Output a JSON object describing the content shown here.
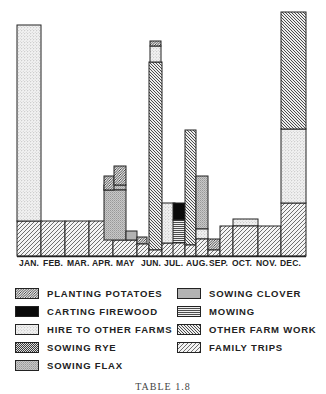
{
  "chart_data": {
    "type": "bar",
    "subtype": "overlapping-stacked-bar",
    "title": "",
    "caption": "TABLE 1.8",
    "xlabel": "",
    "ylabel": "",
    "grid": false,
    "legend_position": "bottom",
    "categories": [
      "JAN.",
      "FEB.",
      "MAR.",
      "APR.",
      "MAY",
      "JUN.",
      "JUL.",
      "AUG.",
      "SEP.",
      "OCT.",
      "NOV.",
      "DEC."
    ],
    "legend": [
      {
        "key": "planting_potatoes",
        "label": "PLANTING POTATOES",
        "pattern": "diag-dense"
      },
      {
        "key": "carting_firewood",
        "label": "CARTING FIREWOOD",
        "pattern": "solid-black"
      },
      {
        "key": "hire_to_other_farms",
        "label": "HIRE TO OTHER FARMS",
        "pattern": "dots-light"
      },
      {
        "key": "sowing_rye",
        "label": "SOWING RYE",
        "pattern": "back-diag-dense"
      },
      {
        "key": "sowing_flax",
        "label": "SOWING FLAX",
        "pattern": "dots-medium"
      },
      {
        "key": "sowing_clover",
        "label": "SOWING CLOVER",
        "pattern": "gray"
      },
      {
        "key": "mowing",
        "label": "MOWING",
        "pattern": "horizontal-lines"
      },
      {
        "key": "other_farm_work",
        "label": "OTHER FARM WORK",
        "pattern": "back-diag"
      },
      {
        "key": "family_trips",
        "label": "FAMILY TRIPS",
        "pattern": "diag"
      }
    ],
    "plot_area": {
      "x0": 17,
      "x1": 306,
      "baseline_y": 256,
      "top_y": 10
    },
    "bars": [
      {
        "month": "JAN.",
        "series": "family_trips",
        "x": 17,
        "w": 24,
        "y0": 256,
        "y1": 221
      },
      {
        "month": "JAN.",
        "series": "hire_to_other_farms",
        "x": 17,
        "w": 24,
        "y0": 221,
        "y1": 25
      },
      {
        "month": "FEB.",
        "series": "family_trips",
        "x": 41,
        "w": 24,
        "y0": 256,
        "y1": 221
      },
      {
        "month": "MAR.",
        "series": "family_trips",
        "x": 65,
        "w": 24,
        "y0": 256,
        "y1": 221
      },
      {
        "month": "APR.",
        "series": "family_trips",
        "x": 89,
        "w": 24,
        "y0": 256,
        "y1": 221
      },
      {
        "month": "APR.",
        "series": "sowing_flax",
        "x": 104,
        "w": 22,
        "y0": 190,
        "y1": 185
      },
      {
        "month": "MAY",
        "series": "family_trips",
        "x": 113,
        "w": 24,
        "y0": 256,
        "y1": 240
      },
      {
        "month": "MAY",
        "series": "sowing_flax",
        "x": 104,
        "w": 22,
        "y0": 240,
        "y1": 190
      },
      {
        "month": "MAY",
        "series": "planting_potatoes",
        "x": 104,
        "w": 10,
        "y0": 190,
        "y1": 176
      },
      {
        "month": "MAY",
        "series": "planting_potatoes",
        "x": 114,
        "w": 12,
        "y0": 185,
        "y1": 166
      },
      {
        "month": "MAY",
        "series": "sowing_clover",
        "x": 126,
        "w": 11,
        "y0": 240,
        "y1": 231
      },
      {
        "month": "MAY",
        "series": "planting_potatoes",
        "x": 137,
        "w": 10,
        "y0": 244,
        "y1": 237
      },
      {
        "month": "MAY",
        "series": "family_trips",
        "x": 137,
        "w": 12,
        "y0": 256,
        "y1": 244
      },
      {
        "month": "JUN.",
        "series": "other_farm_work",
        "x": 149,
        "w": 13,
        "y0": 250,
        "y1": 62
      },
      {
        "month": "JUN.",
        "series": "hire_to_other_farms",
        "x": 150,
        "w": 11,
        "y0": 62,
        "y1": 46
      },
      {
        "month": "JUN.",
        "series": "planting_potatoes",
        "x": 150,
        "w": 11,
        "y0": 46,
        "y1": 41
      },
      {
        "month": "JUN.",
        "series": "family_trips",
        "x": 149,
        "w": 13,
        "y0": 256,
        "y1": 250
      },
      {
        "month": "JUL.",
        "series": "family_trips",
        "x": 162,
        "w": 13,
        "y0": 256,
        "y1": 243
      },
      {
        "month": "JUL.",
        "series": "hire_to_other_farms",
        "x": 162,
        "w": 13,
        "y0": 243,
        "y1": 203
      },
      {
        "month": "JUL.",
        "series": "carting_firewood",
        "x": 173,
        "w": 12,
        "y0": 220,
        "y1": 203
      },
      {
        "month": "JUL.",
        "series": "mowing",
        "x": 173,
        "w": 12,
        "y0": 243,
        "y1": 220
      },
      {
        "month": "JUL.",
        "series": "family_trips",
        "x": 173,
        "w": 12,
        "y0": 256,
        "y1": 243
      },
      {
        "month": "AUG.",
        "series": "other_farm_work",
        "x": 185,
        "w": 11,
        "y0": 245,
        "y1": 130
      },
      {
        "month": "AUG.",
        "series": "family_trips",
        "x": 185,
        "w": 11,
        "y0": 256,
        "y1": 245
      },
      {
        "month": "AUG.",
        "series": "sowing_flax",
        "x": 196,
        "w": 12,
        "y0": 229,
        "y1": 176
      },
      {
        "month": "AUG.",
        "series": "hire_to_other_farms",
        "x": 196,
        "w": 12,
        "y0": 239,
        "y1": 229
      },
      {
        "month": "AUG.",
        "series": "family_trips",
        "x": 196,
        "w": 12,
        "y0": 256,
        "y1": 239
      },
      {
        "month": "SEP.",
        "series": "planting_potatoes",
        "x": 208,
        "w": 12,
        "y0": 250,
        "y1": 239
      },
      {
        "month": "SEP.",
        "series": "family_trips",
        "x": 208,
        "w": 12,
        "y0": 256,
        "y1": 250
      },
      {
        "month": "SEP.",
        "series": "family_trips",
        "x": 220,
        "w": 13,
        "y0": 256,
        "y1": 226
      },
      {
        "month": "OCT.",
        "series": "hire_to_other_farms",
        "x": 233,
        "w": 25,
        "y0": 226,
        "y1": 219
      },
      {
        "month": "OCT.",
        "series": "family_trips",
        "x": 233,
        "w": 25,
        "y0": 256,
        "y1": 226
      },
      {
        "month": "NOV.",
        "series": "family_trips",
        "x": 258,
        "w": 23,
        "y0": 256,
        "y1": 226
      },
      {
        "month": "DEC.",
        "series": "family_trips",
        "x": 281,
        "w": 25,
        "y0": 256,
        "y1": 203
      },
      {
        "month": "DEC.",
        "series": "hire_to_other_farms",
        "x": 281,
        "w": 25,
        "y0": 203,
        "y1": 129
      },
      {
        "month": "DEC.",
        "series": "other_farm_work",
        "x": 281,
        "w": 25,
        "y0": 129,
        "y1": 12
      }
    ]
  },
  "months": [
    {
      "label": "JAN.",
      "x": 19
    },
    {
      "label": "FEB.",
      "x": 43
    },
    {
      "label": "MAR.",
      "x": 67
    },
    {
      "label": "APR.",
      "x": 92
    },
    {
      "label": "MAY",
      "x": 116
    },
    {
      "label": "JUN.",
      "x": 141
    },
    {
      "label": "JUL.",
      "x": 164
    },
    {
      "label": "AUG.",
      "x": 186
    },
    {
      "label": "SEP.",
      "x": 209
    },
    {
      "label": "OCT.",
      "x": 232
    },
    {
      "label": "NOV.",
      "x": 256
    },
    {
      "label": "DEC.",
      "x": 280
    }
  ],
  "legend_items": [
    {
      "label": "PLANTING POTATOES",
      "pattern": "diag-dense",
      "x": 15,
      "y": 7
    },
    {
      "label": "CARTING FIREWOOD",
      "pattern": "solid-black",
      "x": 15,
      "y": 25
    },
    {
      "label": "HIRE TO OTHER FARMS",
      "pattern": "dots-light",
      "x": 15,
      "y": 43
    },
    {
      "label": "SOWING RYE",
      "pattern": "back-diag-dense",
      "x": 15,
      "y": 61
    },
    {
      "label": "SOWING FLAX",
      "pattern": "dots-medium",
      "x": 15,
      "y": 79
    },
    {
      "label": "SOWING CLOVER",
      "pattern": "gray",
      "x": 177,
      "y": 7
    },
    {
      "label": "MOWING",
      "pattern": "horizontal-lines",
      "x": 177,
      "y": 25
    },
    {
      "label": "OTHER FARM WORK",
      "pattern": "back-diag",
      "x": 177,
      "y": 43
    },
    {
      "label": "FAMILY TRIPS",
      "pattern": "diag",
      "x": 177,
      "y": 61
    }
  ],
  "caption": "TABLE 1.8"
}
